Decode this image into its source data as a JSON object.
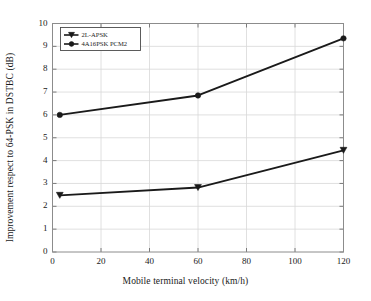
{
  "chart_data": {
    "type": "line",
    "title": "",
    "xlabel": "Mobile terminal velocity (km/h)",
    "ylabel": "Improvement respect to 64-PSK in DSTBC (dB)",
    "xlim": [
      0,
      120
    ],
    "ylim": [
      0,
      10
    ],
    "xticks": [
      0,
      20,
      40,
      60,
      80,
      100,
      120
    ],
    "yticks": [
      0,
      1,
      2,
      3,
      4,
      5,
      6,
      7,
      8,
      9,
      10
    ],
    "xtick_labels": [
      "0",
      "20",
      "40",
      "60",
      "80",
      "100",
      "120"
    ],
    "ytick_labels": [
      "0",
      "1",
      "2",
      "3",
      "4",
      "5",
      "6",
      "7",
      "8",
      "9",
      "10"
    ],
    "grid": true,
    "legend_position": "upper left",
    "x": [
      3,
      60,
      120
    ],
    "series": [
      {
        "name": "2L-APSK",
        "marker": "triangle-down",
        "color": "#1a1a1a",
        "values": [
          2.48,
          2.82,
          4.45
        ]
      },
      {
        "name": "4A16PSK PCM2",
        "marker": "circle",
        "color": "#1a1a1a",
        "values": [
          6.0,
          6.85,
          9.35
        ]
      }
    ]
  },
  "legend": {
    "entries": [
      {
        "label": "2L-APSK"
      },
      {
        "label": "4A16PSK PCM2"
      }
    ]
  },
  "colors": {
    "line": "#1a1a1a",
    "grid": "#d8d8d8",
    "axis": "#9a9a9a",
    "background": "#ffffff"
  }
}
